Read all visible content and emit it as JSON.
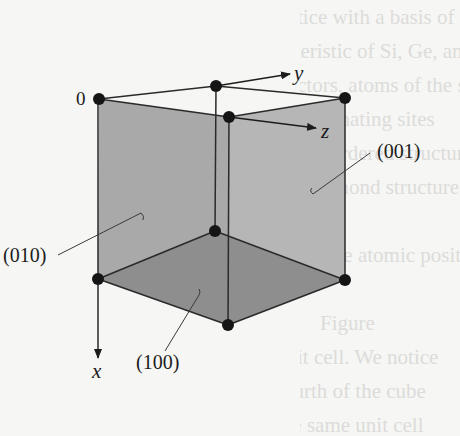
{
  "figure": {
    "origin_label": "0",
    "axes": {
      "x": "x",
      "y": "y",
      "z": "z"
    },
    "planes": [
      {
        "label": "(010)",
        "face": "left"
      },
      {
        "label": "(001)",
        "face": "right"
      },
      {
        "label": "(100)",
        "face": "bottom"
      }
    ],
    "colors": {
      "left_face": "#a9a9a9",
      "right_face": "#b6b6b6",
      "bottom_face": "#8e8e8e",
      "edge": "#2a2a2a",
      "atom": "#151515"
    }
  },
  "bleed_through_text": [
    "lattice with a basis of two atoms, giving",
    "acteristic of Si, Ge, and C in the diamond",
    "ductors, atoms of the same kind",
    "on alternating sites",
    "Thick ordered structure",
    "the diamond structure as follows:",
    "",
    "The atomic positions",
    "",
    "Figure",
    "unit cell. We notice",
    "fourth of the cube",
    "the same unit cell"
  ]
}
